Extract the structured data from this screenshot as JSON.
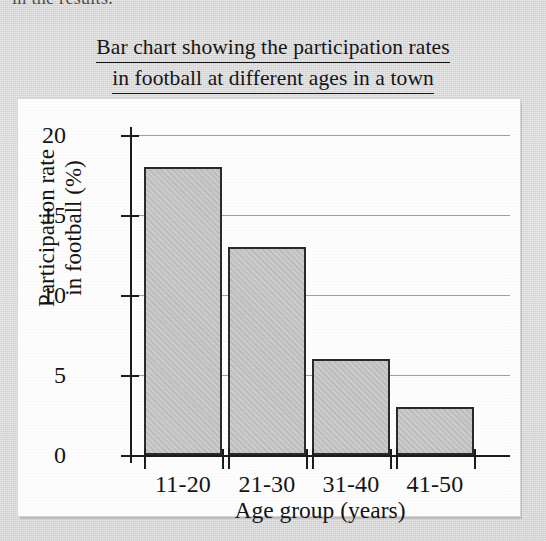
{
  "page": {
    "clipped_text_above": "in the results."
  },
  "figure": {
    "title_line1": "Bar chart showing the participation rates",
    "title_line2": "in football at different ages in a town"
  },
  "chart_data": {
    "type": "bar",
    "title": "Bar chart showing the participation rates in football at different ages in a town",
    "categories": [
      "11-20",
      "21-30",
      "31-40",
      "41-50"
    ],
    "values": [
      18,
      13,
      6,
      3
    ],
    "xlabel": "Age group (years)",
    "ylabel": "Participation rate in football (%)",
    "ylabel_line1": "Participation rate",
    "ylabel_line2": "in football (%)",
    "ylim": [
      0,
      20
    ],
    "ytick_labels": [
      "0",
      "5",
      "10",
      "15",
      "20"
    ],
    "ytick_values": [
      0,
      5,
      10,
      15,
      20
    ],
    "grid": true,
    "grid_axis": "y",
    "legend": null,
    "bar_fill_color": "#c2c2c2",
    "bar_edge_color": "#2a2a2a",
    "axis_color": "#1b1b1b",
    "gridline_color": "#8f8f8f",
    "panel_background": "#fdfdfd",
    "page_background": "#dcdcdc"
  }
}
